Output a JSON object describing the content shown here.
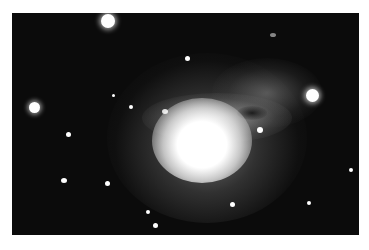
{
  "image": {
    "subject": "galaxy",
    "description": "Grayscale telescope photograph of a bright galaxy with a luminous core, dusty filaments toward upper right, and surrounding field stars",
    "colors": {
      "background": "#0b0b0b",
      "core": "#ffffff",
      "border": "#ffffff"
    }
  }
}
